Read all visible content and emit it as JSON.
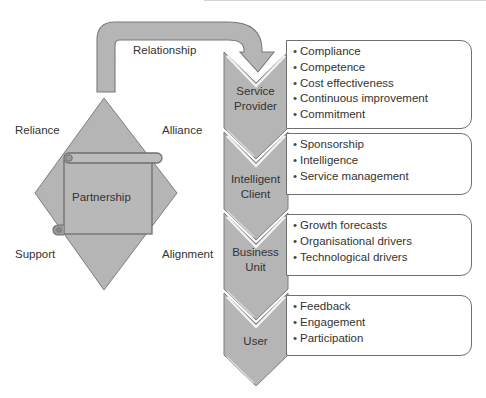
{
  "colors": {
    "shape_fill": "#b5b5b5",
    "shape_stroke": "#7a7a7a",
    "highlight": "#f2f2f2",
    "box_border": "#707070"
  },
  "relationship": {
    "arrow_label": "Relationship"
  },
  "partnership": {
    "center_label": "Partnership",
    "corner_labels": {
      "top_left": "Reliance",
      "top_right": "Alliance",
      "bottom_left": "Support",
      "bottom_right": "Alignment"
    }
  },
  "levels": [
    {
      "label_line1": "Service",
      "label_line2": "Provider",
      "items": [
        "Compliance",
        "Competence",
        "Cost effectiveness",
        "Continuous improvement",
        "Commitment"
      ]
    },
    {
      "label_line1": "Intelligent",
      "label_line2": "Client",
      "items": [
        "Sponsorship",
        "Intelligence",
        "Service management"
      ]
    },
    {
      "label_line1": "Business",
      "label_line2": "Unit",
      "items": [
        "Growth forecasts",
        "Organisational drivers",
        "Technological drivers"
      ]
    },
    {
      "label_line1": "User",
      "label_line2": "",
      "items": [
        "Feedback",
        "Engagement",
        "Participation"
      ]
    }
  ]
}
